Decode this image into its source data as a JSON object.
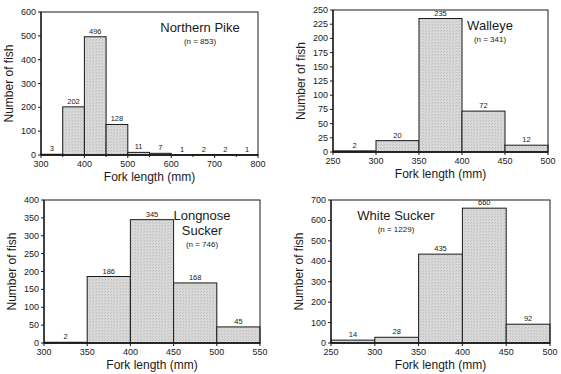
{
  "chart_data": [
    {
      "type": "bar",
      "title": "Northern Pike",
      "subtitle": "(n = 853)",
      "xlabel": "Fork length (mm)",
      "ylabel": "Number of fish",
      "bin_edges": [
        300,
        350,
        400,
        450,
        500,
        550,
        600,
        650,
        700,
        750,
        800
      ],
      "values": [
        3,
        202,
        496,
        128,
        11,
        7,
        1,
        2,
        2,
        1
      ],
      "xlim": [
        300,
        800
      ],
      "ylim": [
        0,
        600
      ],
      "xticks": [
        300,
        400,
        500,
        600,
        700,
        800
      ],
      "yticks": [
        0,
        100,
        200,
        300,
        400,
        500,
        600
      ],
      "grid": false,
      "title_position": "top-right",
      "plot_box": {
        "x0": 41,
        "y0": 12,
        "x1": 258,
        "y1": 155
      }
    },
    {
      "type": "bar",
      "title": "Walleye",
      "subtitle": "(n = 341)",
      "xlabel": "Fork length (mm)",
      "ylabel": "Number of fish",
      "bin_edges": [
        250,
        300,
        350,
        400,
        450,
        500
      ],
      "values": [
        2,
        20,
        235,
        72,
        12
      ],
      "xlim": [
        250,
        500
      ],
      "ylim": [
        0,
        250
      ],
      "xticks": [
        250,
        300,
        350,
        400,
        450,
        500
      ],
      "yticks": [
        0,
        25,
        50,
        75,
        100,
        125,
        150,
        175,
        200,
        225,
        250
      ],
      "grid": false,
      "title_position": "top-right",
      "plot_box": {
        "x0": 333,
        "y0": 10,
        "x1": 548,
        "y1": 152
      }
    },
    {
      "type": "bar",
      "title": "Longnose Sucker",
      "title_lines": [
        "Longnose",
        "Sucker"
      ],
      "subtitle": "(n = 746)",
      "xlabel": "Fork length (mm)",
      "ylabel": "Number of fish",
      "bin_edges": [
        300,
        350,
        400,
        450,
        500,
        550
      ],
      "values": [
        2,
        186,
        345,
        168,
        45
      ],
      "xlim": [
        300,
        550
      ],
      "ylim": [
        0,
        400
      ],
      "xticks": [
        300,
        350,
        400,
        450,
        500,
        550
      ],
      "yticks": [
        0,
        50,
        100,
        150,
        200,
        250,
        300,
        350,
        400
      ],
      "grid": false,
      "title_position": "top-right",
      "plot_box": {
        "x0": 44,
        "y0": 200,
        "x1": 260,
        "y1": 343
      }
    },
    {
      "type": "bar",
      "title": "White Sucker",
      "subtitle": "(n = 1229)",
      "xlabel": "Fork length (mm)",
      "ylabel": "Number of fish",
      "bin_edges": [
        250,
        300,
        350,
        400,
        450,
        500
      ],
      "values": [
        14,
        28,
        435,
        660,
        92
      ],
      "xlim": [
        250,
        500
      ],
      "ylim": [
        0,
        700
      ],
      "xticks": [
        250,
        300,
        350,
        400,
        450,
        500
      ],
      "yticks": [
        0,
        100,
        200,
        300,
        400,
        500,
        600,
        700
      ],
      "grid": false,
      "title_position": "top-left",
      "plot_box": {
        "x0": 331,
        "y0": 200,
        "x1": 550,
        "y1": 343
      }
    }
  ],
  "style": {
    "bar_fill": "#d6d6d6",
    "line_color": "#1a1a1a",
    "background": "#ffffff"
  }
}
